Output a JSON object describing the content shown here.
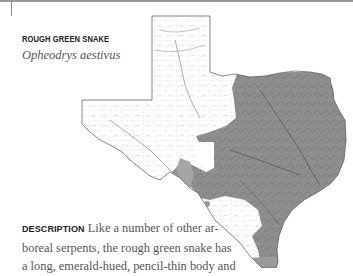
{
  "species": {
    "common_name": "ROUGH GREEN SNAKE",
    "scientific_name": "Opheodrys aestivus"
  },
  "map": {
    "region": "Texas",
    "legend_meaning": "shaded area = range",
    "range_color": "#8f8f8f",
    "outline_color": "#555555"
  },
  "description": {
    "label": "DESCRIPTION",
    "lines": [
      " Like a number of other ar-",
      "boreal serpents, the rough green snake has",
      "a long, emerald-hued, pencil-thin body and"
    ]
  }
}
